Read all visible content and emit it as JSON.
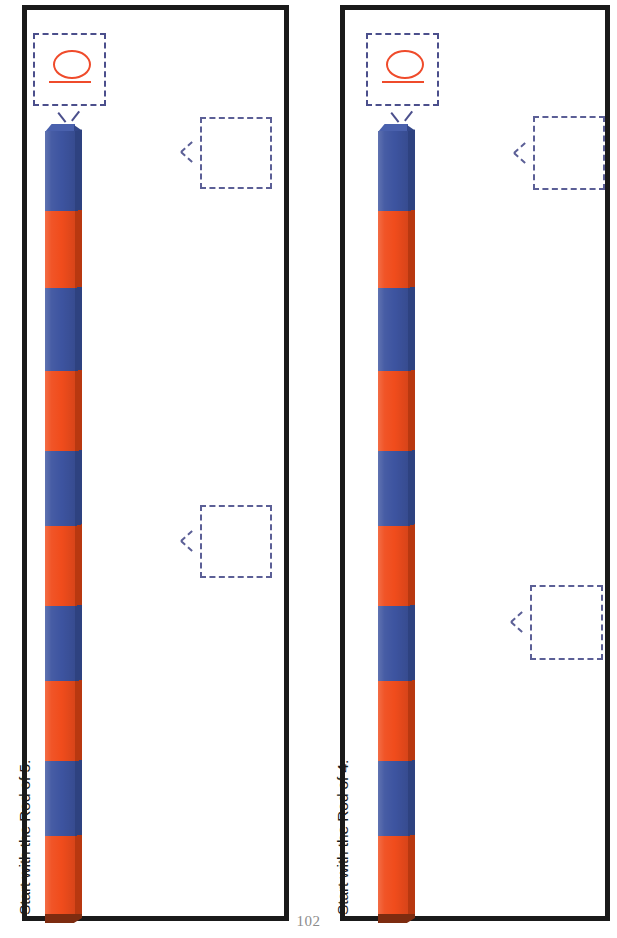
{
  "page": {
    "number": "102",
    "background_color": "#ffffff",
    "width": 617,
    "height": 938
  },
  "colors": {
    "rod_blue": "#3d54a0",
    "rod_orange": "#f04c1c",
    "rod_blue_shadow": "#2e4280",
    "rod_orange_shadow": "#b83810",
    "rod_end_dark": "#7d2c10",
    "panel_border": "#1a1a1a",
    "dashed_box": "#5b5f96",
    "handwriting": "#ef4b2b",
    "page_number": "#8c8c8c",
    "label_text": "#1b1b1b"
  },
  "panels": [
    {
      "id": "left",
      "prompt": "Start with the Rod of 5.",
      "start_box": {
        "glyph_name": "handwritten-zero",
        "value": "0"
      },
      "rod": {
        "orientation": "vertical",
        "segments": [
          {
            "color": "blue",
            "percent": 10.2
          },
          {
            "color": "orange",
            "percent": 9.8
          },
          {
            "color": "blue",
            "percent": 10.6
          },
          {
            "color": "orange",
            "percent": 10.2
          },
          {
            "color": "blue",
            "percent": 9.5
          },
          {
            "color": "orange",
            "percent": 10.2
          },
          {
            "color": "blue",
            "percent": 9.6
          },
          {
            "color": "orange",
            "percent": 10.2
          },
          {
            "color": "blue",
            "percent": 9.5
          },
          {
            "color": "orange",
            "percent": 10.2
          }
        ]
      },
      "answer_boxes": [
        {
          "name": "answer-box-1",
          "value": "",
          "top": 117,
          "left": 200
        },
        {
          "name": "answer-box-2",
          "value": "",
          "top": 505,
          "left": 200
        }
      ]
    },
    {
      "id": "right",
      "prompt": "Start with the Rod of 4.",
      "start_box": {
        "glyph_name": "handwritten-zero",
        "value": "0"
      },
      "rod": {
        "orientation": "vertical",
        "segments": [
          {
            "color": "blue",
            "percent": 10.2
          },
          {
            "color": "orange",
            "percent": 9.8
          },
          {
            "color": "blue",
            "percent": 10.6
          },
          {
            "color": "orange",
            "percent": 10.2
          },
          {
            "color": "blue",
            "percent": 9.5
          },
          {
            "color": "orange",
            "percent": 10.2
          },
          {
            "color": "blue",
            "percent": 9.6
          },
          {
            "color": "orange",
            "percent": 10.2
          },
          {
            "color": "blue",
            "percent": 9.5
          },
          {
            "color": "orange",
            "percent": 10.2
          }
        ]
      },
      "answer_boxes": [
        {
          "name": "answer-box-1",
          "value": "",
          "top": 116,
          "left": 533
        },
        {
          "name": "answer-box-2",
          "value": "",
          "top": 585,
          "left": 530
        }
      ]
    }
  ]
}
